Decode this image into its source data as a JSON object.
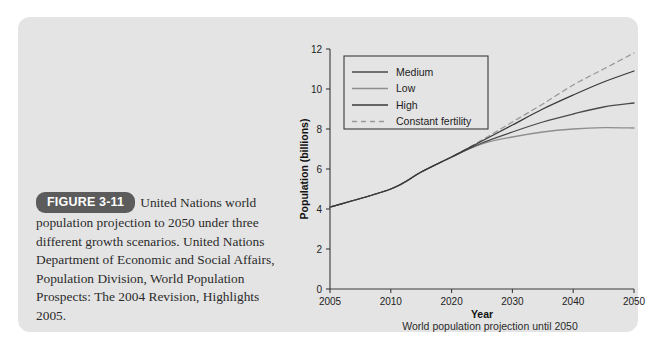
{
  "figure": {
    "badge_label": "FIGURE 3-11",
    "caption": "United Nations world population projection to 2050 under three different growth scenarios. United Nations Department of Economic and Social Affairs, Population Division, World Population Prospects: The 2004 Revision, Highlights 2005.",
    "subcaption": "World population projection until 2050",
    "panel_color": "#e4e4e4",
    "badge_color": "#5c5c5c"
  },
  "chart_data": {
    "type": "line",
    "title": "",
    "xlabel": "Year",
    "ylabel": "Population (billions)",
    "xlim": [
      2005,
      2050
    ],
    "ylim": [
      0,
      12
    ],
    "xticks": [
      2005,
      2010,
      2020,
      2030,
      2040,
      2050
    ],
    "xticklabels": [
      "2005",
      "2010",
      "2020",
      "2030",
      "2040",
      "2050"
    ],
    "yticks": [
      0,
      2,
      4,
      6,
      8,
      10,
      12
    ],
    "yticklabels": [
      "0",
      "2",
      "4",
      "6",
      "8",
      "10",
      "12"
    ],
    "grid": false,
    "legend_position": "upper-left",
    "x": [
      2005,
      2010,
      2015,
      2020,
      2025,
      2030,
      2035,
      2040,
      2045,
      2050
    ],
    "series": [
      {
        "name": "Medium",
        "color": "#4a4a4a",
        "dash": "none",
        "width": 1.3,
        "values": [
          4.1,
          5.0,
          5.85,
          6.6,
          7.3,
          7.85,
          8.35,
          8.75,
          9.1,
          9.3
        ]
      },
      {
        "name": "Low",
        "color": "#8e8e8e",
        "dash": "none",
        "width": 1.3,
        "values": [
          4.1,
          5.0,
          5.85,
          6.6,
          7.25,
          7.6,
          7.85,
          8.0,
          8.07,
          8.05
        ]
      },
      {
        "name": "High",
        "color": "#3a3a3a",
        "dash": "none",
        "width": 1.3,
        "values": [
          4.1,
          5.0,
          5.85,
          6.6,
          7.4,
          8.2,
          9.0,
          9.7,
          10.35,
          10.9
        ]
      },
      {
        "name": "Constant fertility",
        "color": "#9a9a9a",
        "dash": "5,4",
        "width": 1.3,
        "values": [
          4.1,
          5.0,
          5.85,
          6.6,
          7.45,
          8.35,
          9.25,
          10.2,
          11.0,
          11.8
        ]
      }
    ]
  }
}
